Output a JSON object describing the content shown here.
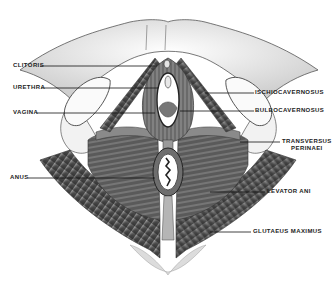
{
  "figure": {
    "style": "grayscale pencil illustration"
  },
  "labels": {
    "left": [
      {
        "text": "CLITORIS",
        "x": 13,
        "y": 63,
        "line": {
          "x1": 40,
          "y1": 66,
          "x2": 157,
          "y2": 66
        }
      },
      {
        "text": "URETHRA",
        "x": 13,
        "y": 85,
        "line": {
          "x1": 41,
          "y1": 88,
          "x2": 158,
          "y2": 88
        }
      },
      {
        "text": "VAGINA",
        "x": 13,
        "y": 110,
        "line": {
          "x1": 36,
          "y1": 113,
          "x2": 155,
          "y2": 113
        }
      },
      {
        "text": "ANUS",
        "x": 10,
        "y": 175,
        "line": {
          "x1": 28,
          "y1": 178,
          "x2": 155,
          "y2": 178
        }
      }
    ],
    "right": [
      {
        "text": "ISCHIOCAVERNOSUS",
        "x": 255,
        "y": 90,
        "line": {
          "x1": 205,
          "y1": 93,
          "x2": 254,
          "y2": 93
        }
      },
      {
        "text": "BULBOCAVERNOSUS",
        "x": 255,
        "y": 108,
        "line": {
          "x1": 180,
          "y1": 111,
          "x2": 254,
          "y2": 111
        }
      },
      {
        "text": "TRANSVERSUS",
        "text2": "PERINAEI",
        "x": 282,
        "y": 139,
        "line": {
          "x1": 240,
          "y1": 142,
          "x2": 280,
          "y2": 142
        }
      },
      {
        "text": "LEVATOR ANI",
        "x": 267,
        "y": 188,
        "line": {
          "x1": 210,
          "y1": 192,
          "x2": 265,
          "y2": 192
        }
      },
      {
        "text": "GLUTAEUS MAXIMUS",
        "x": 253,
        "y": 229,
        "line": {
          "x1": 210,
          "y1": 232,
          "x2": 251,
          "y2": 232
        }
      }
    ]
  },
  "colors": {
    "background": "#ffffff",
    "ink": "#222222",
    "muscle_dark": "#4a4a4a",
    "muscle_mid": "#7a7a7a",
    "muscle_light": "#b5b5b5",
    "skin": "#eeeeee"
  }
}
